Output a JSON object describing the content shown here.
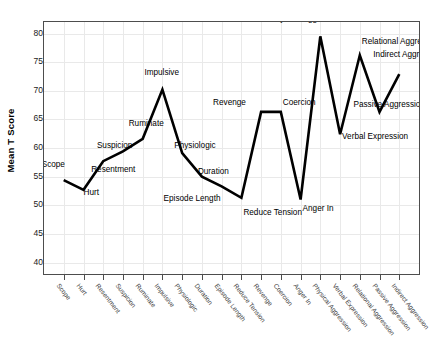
{
  "chart_data": {
    "type": "line",
    "title": "",
    "xlabel": "",
    "ylabel": "Mean T Score",
    "ylim": [
      38,
      82
    ],
    "yticks": [
      40,
      45,
      50,
      55,
      60,
      65,
      70,
      75,
      80
    ],
    "grid": true,
    "legend": "none",
    "line_color": "#000000",
    "frame_color": "#4d4d4d",
    "grid_color": "#e9e9e9",
    "categories": [
      "Scope",
      "Hurt",
      "Resentment",
      "Suspicion",
      "Ruminate",
      "Impulsive",
      "Physiologic",
      "Duration",
      "Episode Length",
      "Reduce Tension",
      "Revenge",
      "Coercion",
      "Anger In",
      "Physical Aggression",
      "Verbal Expression",
      "Relational Aggression",
      "Passive Aggression",
      "Indirect Aggression"
    ],
    "values": [
      54.4,
      52.7,
      57.7,
      59.4,
      61.6,
      70.2,
      59.1,
      55.0,
      53.3,
      51.3,
      66.3,
      66.3,
      51.0,
      79.5,
      62.4,
      76.2,
      66.3,
      72.9
    ],
    "point_labels": [
      "Scope",
      "Hurt",
      "Resentment",
      "Suspicion",
      "Ruminate",
      "Impulsive",
      "Physiologic",
      "Duration",
      "Episode Length",
      "Reduce Tension",
      "Revenge",
      "Coercion",
      "Anger In",
      "Physical Aggression",
      "Verbal Expression",
      "Relational Aggression",
      "Passive Aggression",
      "Indirect Aggression"
    ]
  }
}
